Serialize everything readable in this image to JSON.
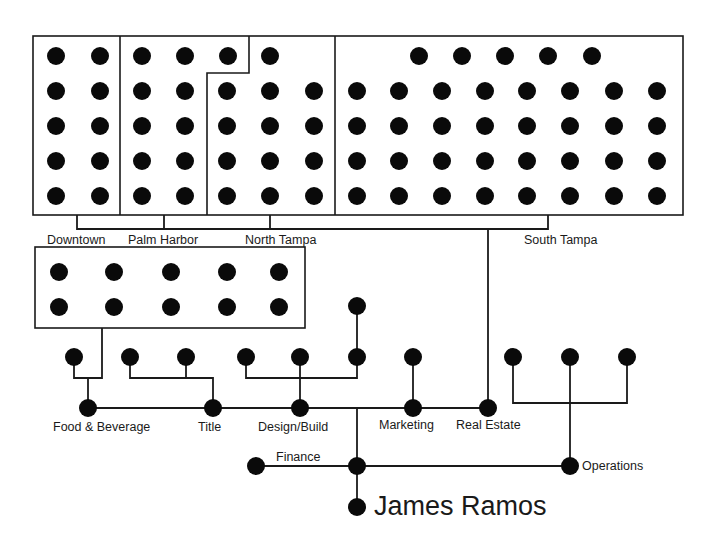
{
  "title": "James Ramos",
  "regions": [
    {
      "label": "Downtown"
    },
    {
      "label": "Palm Harbor"
    },
    {
      "label": "North Tampa"
    },
    {
      "label": "South Tampa"
    }
  ],
  "departments": [
    {
      "label": "Food & Beverage"
    },
    {
      "label": "Title"
    },
    {
      "label": "Design/Build"
    },
    {
      "label": "Marketing"
    },
    {
      "label": "Real Estate"
    }
  ],
  "branches": [
    {
      "label": "Finance"
    },
    {
      "label": "Operations"
    }
  ],
  "colors": {
    "ink": "#0a0a0a",
    "background": "#ffffff"
  }
}
